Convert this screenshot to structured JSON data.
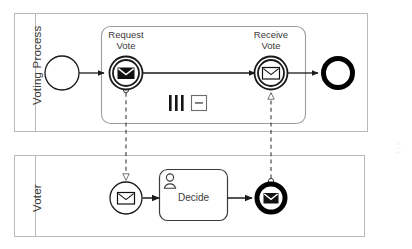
{
  "diagram": {
    "type": "bpmn-collaboration",
    "colors": {
      "stroke": "#3a3a3a",
      "pool_stroke": "#b8b8b8",
      "subprocess_stroke": "#9a9a9a",
      "fill": "#ffffff",
      "black": "#000000",
      "text": "#3a3a3a"
    }
  },
  "pools": [
    {
      "id": "voting-process",
      "label": "Voting Process",
      "label_orientation": "vertical"
    },
    {
      "id": "voter",
      "label": "Voter",
      "label_orientation": "vertical"
    }
  ],
  "voting_process": {
    "start_event": {
      "name": "start-event",
      "label": "",
      "shape": "thin-circle"
    },
    "subprocess": {
      "name": "multi-instance-subprocess",
      "label": "",
      "markers": [
        {
          "name": "parallel-multi-instance-marker",
          "glyph": "|||"
        },
        {
          "name": "collapsed-subprocess-marker",
          "glyph": "−"
        }
      ]
    },
    "events": [
      {
        "name": "request-vote-event",
        "label_line1": "Request",
        "label_line2": "Vote",
        "kind": "intermediate-throw-message",
        "envelope": "filled"
      },
      {
        "name": "receive-vote-event",
        "label_line1": "Receive",
        "label_line2": "Vote",
        "kind": "intermediate-catch-message",
        "envelope": "outline"
      }
    ],
    "end_event": {
      "name": "end-event",
      "label": "",
      "shape": "thick-circle"
    }
  },
  "voter": {
    "start_event": {
      "name": "message-start-event",
      "label": "",
      "kind": "start-message",
      "envelope": "outline"
    },
    "task": {
      "name": "decide-user-task",
      "label": "Decide",
      "kind": "user-task",
      "icon": "user-icon"
    },
    "end_event": {
      "name": "message-end-event",
      "label": "",
      "kind": "end-message",
      "envelope": "filled"
    }
  },
  "flows": [
    {
      "name": "sequence-flow-start-to-request",
      "kind": "sequence"
    },
    {
      "name": "sequence-flow-request-to-receive",
      "kind": "sequence"
    },
    {
      "name": "sequence-flow-receive-to-end",
      "kind": "sequence"
    },
    {
      "name": "message-flow-request-to-voter-start",
      "kind": "message"
    },
    {
      "name": "message-flow-voter-end-to-receive",
      "kind": "message"
    },
    {
      "name": "sequence-flow-voterstart-to-decide",
      "kind": "sequence"
    },
    {
      "name": "sequence-flow-decide-to-voterend",
      "kind": "sequence"
    }
  ]
}
